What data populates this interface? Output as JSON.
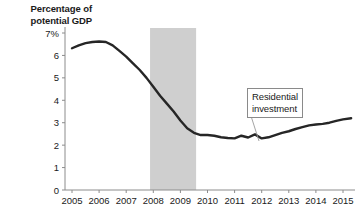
{
  "chart_data": {
    "type": "line",
    "title": "Percentage of potential GDP",
    "xlabel": "",
    "ylabel": "Percentage of potential GDP",
    "xlim": [
      2005,
      2015.4
    ],
    "ylim": [
      0,
      7
    ],
    "grid": false,
    "legend_position": "none",
    "y_ticks": [
      "0",
      "1",
      "2",
      "3",
      "4",
      "5",
      "6",
      "7%"
    ],
    "y_tick_values": [
      0,
      1,
      2,
      3,
      4,
      5,
      6,
      7
    ],
    "x_ticks": [
      "2005",
      "2006",
      "2007",
      "2008",
      "2009",
      "2010",
      "2011",
      "2012",
      "2013",
      "2014",
      "2015"
    ],
    "x_tick_values": [
      2005,
      2006,
      2007,
      2008,
      2009,
      2010,
      2011,
      2012,
      2013,
      2014,
      2015
    ],
    "series": [
      {
        "name": "Residential investment",
        "color": "#262626",
        "x": [
          2005.0,
          2005.25,
          2005.5,
          2005.75,
          2006.0,
          2006.25,
          2006.5,
          2006.75,
          2007.0,
          2007.25,
          2007.5,
          2007.75,
          2008.0,
          2008.25,
          2008.5,
          2008.75,
          2009.0,
          2009.25,
          2009.5,
          2009.75,
          2010.0,
          2010.25,
          2010.5,
          2010.75,
          2011.0,
          2011.25,
          2011.5,
          2011.75,
          2012.0,
          2012.25,
          2012.5,
          2012.75,
          2013.0,
          2013.25,
          2013.5,
          2013.75,
          2014.0,
          2014.25,
          2014.5,
          2014.75,
          2015.0,
          2015.3
        ],
        "values": [
          6.32,
          6.45,
          6.55,
          6.6,
          6.62,
          6.6,
          6.45,
          6.2,
          5.95,
          5.65,
          5.35,
          5.0,
          4.6,
          4.2,
          3.85,
          3.5,
          3.1,
          2.75,
          2.55,
          2.45,
          2.45,
          2.42,
          2.35,
          2.32,
          2.3,
          2.42,
          2.34,
          2.48,
          2.3,
          2.35,
          2.45,
          2.55,
          2.62,
          2.72,
          2.8,
          2.88,
          2.92,
          2.95,
          3.0,
          3.08,
          3.15,
          3.2
        ]
      }
    ],
    "shaded_regions": [
      {
        "name": "recession-band",
        "x_start": 2007.88,
        "x_end": 2009.58,
        "color": "#cfcfcf"
      }
    ],
    "annotations": [
      {
        "name": "residential-investment-callout",
        "text_line1": "Residential",
        "text_line2": "investment",
        "box_x": 247,
        "box_y": 88,
        "leader_to_x": 259,
        "leader_to_y": 141
      }
    ],
    "colors": {
      "line": "#262626",
      "axis": "#8c8c8c",
      "band": "#cfcfcf",
      "text": "#1a1a1a"
    }
  }
}
